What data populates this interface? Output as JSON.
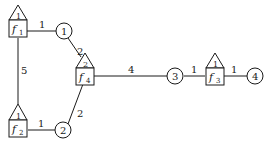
{
  "diagram": {
    "factors": [
      {
        "id": "f1",
        "name": "f",
        "sub": "1",
        "tri": "1"
      },
      {
        "id": "f2",
        "name": "f",
        "sub": "2",
        "tri": "1"
      },
      {
        "id": "f3",
        "name": "f",
        "sub": "3",
        "tri": "1"
      },
      {
        "id": "f4",
        "name": "f",
        "sub": "4",
        "tri": "2"
      }
    ],
    "variables": [
      {
        "id": "v1",
        "label": "1"
      },
      {
        "id": "v2",
        "label": "2"
      },
      {
        "id": "v3",
        "label": "3"
      },
      {
        "id": "v4",
        "label": "4"
      }
    ],
    "edges": [
      {
        "from": "f1",
        "to": "v1",
        "label": "1"
      },
      {
        "from": "v1",
        "to": "f4",
        "label": "2"
      },
      {
        "from": "f1",
        "to": "f2",
        "label": "5"
      },
      {
        "from": "f2",
        "to": "v2",
        "label": "1"
      },
      {
        "from": "v2",
        "to": "f4",
        "label": "2"
      },
      {
        "from": "f4",
        "to": "v3",
        "label": "4"
      },
      {
        "from": "v3",
        "to": "f3",
        "label": "1"
      },
      {
        "from": "f3",
        "to": "v4",
        "label": "1"
      }
    ]
  }
}
